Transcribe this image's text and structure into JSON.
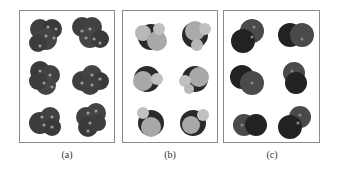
{
  "figure": {
    "panels": [
      {
        "id": "a",
        "label": "(a)",
        "description": "Space-filling models, dark gray multi-atom clusters with light highlights (4-5 atoms each)",
        "molecules": 6,
        "fill": "#3e3e3e",
        "highlight": "#8a8a8a"
      },
      {
        "id": "b",
        "label": "(b)",
        "description": "Space-filling models with dark central atom and light gray surrounding atoms (tetrahedral)",
        "molecules": 6,
        "center_fill": "#2a2a2a",
        "outer_fill": "#b5b5b5"
      },
      {
        "id": "c",
        "label": "(c)",
        "description": "Space-filling diatomic-like models, two overlapping dark spheres",
        "molecules": 6,
        "fill": "#222222",
        "second_fill": "#4a4a4a"
      }
    ]
  }
}
